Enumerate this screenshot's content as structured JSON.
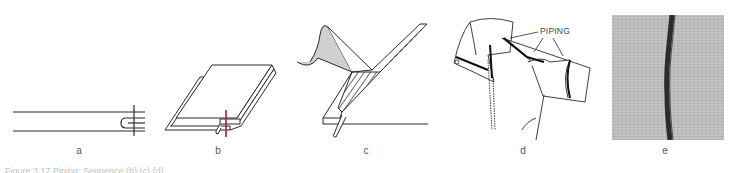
{
  "figure": {
    "panels": [
      {
        "id": "a",
        "label": "a",
        "description": "piping seam cross-section diagram"
      },
      {
        "id": "b",
        "label": "b",
        "description": "layered fabric with piping and red stitch line"
      },
      {
        "id": "c",
        "label": "c",
        "description": "folding facing over hatched piping strip"
      },
      {
        "id": "d",
        "label": "d",
        "description": "garment collar and sleeve with piping",
        "callout": "PIPING"
      },
      {
        "id": "e",
        "label": "e",
        "description": "photograph of piped seam on grey fabric"
      }
    ],
    "caption": "Figure 3.17 Piping: Sequence (b) (c) (d)",
    "colors": {
      "line": "#2a2a2a",
      "stitch_red": "#b0202a",
      "shading": "#d0d0d0",
      "photo_fabric": "#bdbdbd",
      "photo_piping": "#2b2b2b"
    }
  }
}
